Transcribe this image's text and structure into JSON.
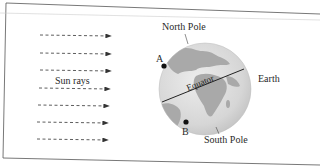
{
  "diagram": {
    "labels": {
      "north_pole": "North Pole",
      "south_pole": "South Pole",
      "earth": "Earth",
      "equator": "Equator",
      "sun_rays": "Sun rays",
      "point_a": "A",
      "point_b": "B"
    },
    "sun_rays": {
      "count": 7,
      "y_positions": [
        35,
        53,
        71,
        89,
        107,
        125,
        142
      ],
      "x_start": 40,
      "x_end": 112
    },
    "colors": {
      "frame": "#555555",
      "ocean": "#d9d9d9",
      "land": "#a9a9a9",
      "ray": "#333333",
      "point": "#111111",
      "text": "#2a2a2a"
    }
  }
}
